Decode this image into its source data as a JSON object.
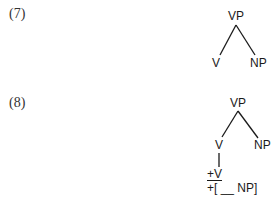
{
  "examples": [
    {
      "number": "(7)",
      "tree": {
        "root": "VP",
        "children": [
          "V",
          "NP"
        ]
      }
    },
    {
      "number": "(8)",
      "tree": {
        "root": "VP",
        "children": [
          "V",
          "NP"
        ],
        "v_features": {
          "category": "+V",
          "subcat": "+[ __ NP]"
        }
      }
    }
  ]
}
